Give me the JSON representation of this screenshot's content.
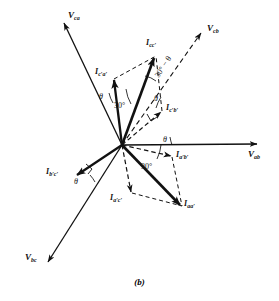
{
  "figure": {
    "caption": "(b)",
    "type": "phasor-diagram",
    "origin": {
      "x": 122,
      "y": 145
    },
    "colors": {
      "ink": "#111111",
      "background": "#ffffff"
    }
  },
  "voltages": [
    {
      "key": "v_ca",
      "label_main": "V",
      "label_sub": "ca",
      "style": "solid-thin",
      "tip": {
        "x": 63,
        "y": 22
      },
      "label_pos": {
        "x": 68,
        "y": 12
      }
    },
    {
      "key": "v_cb",
      "label_main": "V",
      "label_sub": "cb",
      "style": "dashed",
      "tip": {
        "x": 202,
        "y": 32
      },
      "label_pos": {
        "x": 206,
        "y": 26
      }
    },
    {
      "key": "v_ab",
      "label_main": "V",
      "label_sub": "ab",
      "style": "solid-thin",
      "tip": {
        "x": 258,
        "y": 144
      },
      "label_pos": {
        "x": 248,
        "y": 152
      }
    },
    {
      "key": "v_bc",
      "label_main": "V",
      "label_sub": "bc",
      "style": "solid-thin",
      "tip": {
        "x": 47,
        "y": 263
      },
      "label_pos": {
        "x": 28,
        "y": 254
      }
    }
  ],
  "currents": [
    {
      "key": "i_cc",
      "label_main": "I",
      "label_sub": "cc′",
      "style": "solid-thick",
      "tip": {
        "x": 155,
        "y": 57
      },
      "label_pos": {
        "x": 148,
        "y": 44
      }
    },
    {
      "key": "i_ca",
      "label_main": "I",
      "label_sub": "c′a′",
      "style": "solid-thick",
      "tip": {
        "x": 113,
        "y": 78
      },
      "label_pos": {
        "x": 97,
        "y": 72
      }
    },
    {
      "key": "i_cb",
      "label_main": "I",
      "label_sub": "c′b′",
      "style": "dashed",
      "tip": {
        "x": 163,
        "y": 111
      },
      "label_pos": {
        "x": 166,
        "y": 107
      }
    },
    {
      "key": "i_aa",
      "label_main": "I",
      "label_sub": "aa′",
      "style": "solid-thick",
      "tip": {
        "x": 181,
        "y": 206
      },
      "label_pos": {
        "x": 183,
        "y": 203
      }
    },
    {
      "key": "i_ab",
      "label_main": "I",
      "label_sub": "a′b′",
      "style": "dashed",
      "tip": {
        "x": 172,
        "y": 157
      },
      "label_pos": {
        "x": 175,
        "y": 155
      }
    },
    {
      "key": "i_ac",
      "label_main": "I",
      "label_sub": "a′c′",
      "style": "dashed",
      "tip": {
        "x": 131,
        "y": 194
      },
      "label_pos": {
        "x": 113,
        "y": 196
      }
    },
    {
      "key": "i_bc",
      "label_main": "I",
      "label_sub": "b′c′",
      "style": "solid-thick",
      "tip": {
        "x": 76,
        "y": 176
      },
      "label_pos": {
        "x": 49,
        "y": 171
      }
    }
  ],
  "angles": [
    {
      "key": "theta_upper_left",
      "text": "θ",
      "pos": {
        "x": 101,
        "y": 98
      }
    },
    {
      "key": "thirty_upper",
      "text": "30",
      "unit": "°",
      "pos": {
        "x": 116,
        "y": 100
      }
    },
    {
      "key": "thirty_minus_theta",
      "text": "30° − θ",
      "pos": {
        "x": 161,
        "y": 77
      },
      "rotation": -57
    },
    {
      "key": "theta_right_upper",
      "text": "θ",
      "pos": {
        "x": 155,
        "y": 100
      }
    },
    {
      "key": "theta_right_lower",
      "text": "θ",
      "pos": {
        "x": 163,
        "y": 142
      }
    },
    {
      "key": "thirty_lower",
      "text": "30",
      "unit": "°",
      "pos": {
        "x": 145,
        "y": 160
      }
    },
    {
      "key": "theta_lower_left",
      "text": "θ",
      "pos": {
        "x": 75,
        "y": 183
      }
    }
  ]
}
